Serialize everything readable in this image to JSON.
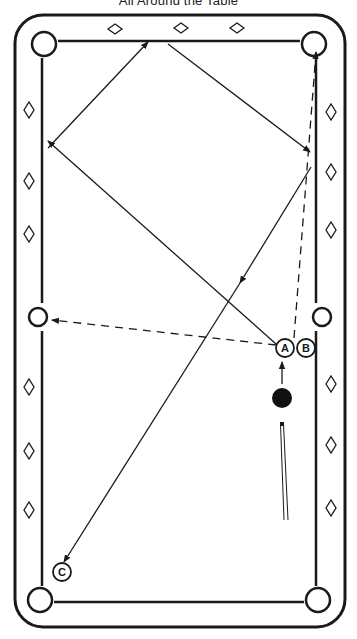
{
  "title": "All Around the Table",
  "colors": {
    "ink": "#1a1a1a",
    "background": "#ffffff",
    "cue_ball": "#111111"
  },
  "table": {
    "outer_rail": {
      "x": 15,
      "y": 15,
      "w": 330,
      "h": 612,
      "r": 28
    },
    "cushion": {
      "left": 42,
      "right": 316,
      "top": 41,
      "bottom": 602
    },
    "pockets": [
      {
        "id": "top-left",
        "cx": 44,
        "cy": 44
      },
      {
        "id": "top-right",
        "cx": 314,
        "cy": 44
      },
      {
        "id": "middle-left",
        "cx": 38,
        "cy": 317
      },
      {
        "id": "middle-right",
        "cx": 322,
        "cy": 317
      },
      {
        "id": "bottom-left",
        "cx": 40,
        "cy": 600
      },
      {
        "id": "bottom-right",
        "cx": 318,
        "cy": 600
      }
    ],
    "diamonds": {
      "top": [
        [
          115,
          29
        ],
        [
          181,
          28
        ],
        [
          237,
          28
        ]
      ],
      "left": [
        [
          29,
          110
        ],
        [
          29,
          181
        ],
        [
          29,
          234
        ],
        [
          29,
          387
        ],
        [
          29,
          451
        ],
        [
          29,
          510
        ]
      ],
      "right": [
        [
          331,
          112
        ],
        [
          331,
          172
        ],
        [
          331,
          230
        ],
        [
          331,
          384
        ],
        [
          331,
          445
        ],
        [
          331,
          508
        ]
      ]
    }
  },
  "balls": [
    {
      "label": "A",
      "cx": 285,
      "cy": 348,
      "type": "object"
    },
    {
      "label": "B",
      "cx": 306,
      "cy": 348,
      "type": "object"
    },
    {
      "label": "C",
      "cx": 62,
      "cy": 572,
      "type": "object"
    },
    {
      "label": "",
      "cx": 282,
      "cy": 398,
      "type": "cue"
    }
  ],
  "paths": [
    {
      "name": "cue-ball-path",
      "style": "solid",
      "points": [
        [
          282,
          384
        ],
        [
          282,
          362
        ]
      ],
      "arrow": true
    },
    {
      "name": "ball-a-leg-1",
      "style": "solid",
      "points": [
        [
          276,
          344
        ],
        [
          48,
          141
        ]
      ],
      "arrow": true
    },
    {
      "name": "ball-a-leg-2",
      "style": "solid",
      "points": [
        [
          48,
          148
        ],
        [
          148,
          42
        ]
      ],
      "arrow": true
    },
    {
      "name": "ball-a-leg-3",
      "style": "solid",
      "points": [
        [
          168,
          44
        ],
        [
          310,
          152
        ]
      ],
      "arrow": true
    },
    {
      "name": "ball-a-leg-4",
      "style": "solid",
      "points": [
        [
          311,
          167
        ],
        [
          240,
          283
        ]
      ],
      "arrow": true
    },
    {
      "name": "ball-a-leg-5",
      "style": "solid",
      "points": [
        [
          240,
          283
        ],
        [
          64,
          562
        ]
      ],
      "arrow": true
    },
    {
      "name": "cue-ball-to-side-pocket",
      "style": "dashed",
      "points": [
        [
          276,
          345
        ],
        [
          52,
          320
        ]
      ],
      "arrow": true
    },
    {
      "name": "ball-b-to-corner",
      "style": "dashed",
      "points": [
        [
          294,
          338
        ],
        [
          316,
          52
        ]
      ],
      "arrow": true
    }
  ],
  "cue_stick": {
    "tip": [
      282,
      424
    ],
    "butt": [
      286,
      520
    ]
  }
}
